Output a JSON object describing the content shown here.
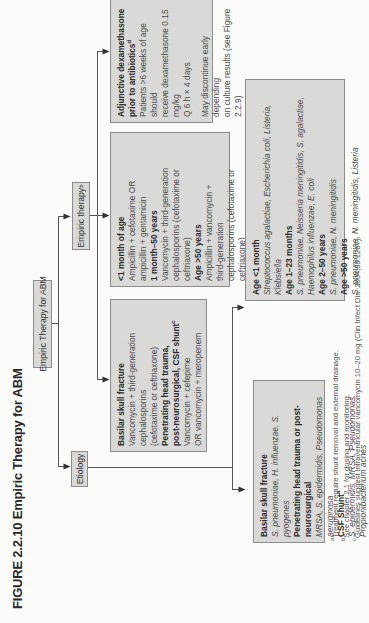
{
  "figure": {
    "title": "FIGURE 2.2.10  Empiric Therapy for ABM"
  },
  "nodes": {
    "root": {
      "label": "Empiric Therapy for ABM"
    },
    "etiology": {
      "label": "Etiology"
    },
    "empiric": {
      "label": "Empiric therapy",
      "sup": "b"
    }
  },
  "treatment_special": {
    "lines": [
      {
        "text": "Basilar skull fracture",
        "bold": true
      },
      {
        "text": "Vancomycin + third-generation"
      },
      {
        "text": "cephalosporins"
      },
      {
        "text": "(cefotaxime or ceftriaxone)"
      },
      {
        "text": "Penetrating head trauma,",
        "bold": true
      },
      {
        "text": "post-neurosurgical, CSF shunt",
        "bold": true,
        "sup": "c"
      },
      {
        "text": "Vancomycin + cefepime"
      },
      {
        "text": "OR vancomycin + meropenem"
      }
    ]
  },
  "treatment_age": {
    "lines": [
      {
        "text": "<1 month of age",
        "bold": true
      },
      {
        "text": "Ampicillin + cefotaxime OR"
      },
      {
        "text": "ampicillin + gentamicin"
      },
      {
        "text": "1 month–50 years",
        "bold": true
      },
      {
        "text": "Vancomycin + third-generation"
      },
      {
        "text": "cephalosporins (cefotaxime or ceftriaxone)"
      },
      {
        "text": "Age >50 years",
        "bold": true
      },
      {
        "text": "Ampicillin + vancomycin +"
      },
      {
        "text": "third-generation"
      },
      {
        "text": "cephalosporins (cefotaxime or ceftriaxone)"
      }
    ]
  },
  "dexamethasone": {
    "title1": "Adjunctive dexamethasone",
    "title2": "prior to antibiotics",
    "title2_sup": "d",
    "lines": [
      "Patients >6 weeks of age should",
      "receive dexamethasone 0.15 mg/kg",
      "Q 6 h × 4 days"
    ],
    "note": [
      "May discontinue early depending",
      "on culture results (see Figure 2.2.9)"
    ]
  },
  "organisms_age": {
    "lines": [
      {
        "text": "Age <1 month",
        "bold": true
      },
      {
        "text": "Streptococcus agalactiae, Escherichia coli, Listeria, Klebsiella",
        "italic": true
      },
      {
        "text": "Age 1–23 months",
        "bold": true
      },
      {
        "text": "S. pneumoniae, Neisseria meningitidis, S. agalactiae, Haemophilus influenzae, E. coli",
        "italic": true
      },
      {
        "text": "Age 2–50 years",
        "bold": true
      },
      {
        "text": "S. pneumoniae, N. meningitidis",
        "italic": true
      },
      {
        "text": "Age >50 years",
        "bold": true
      },
      {
        "text": "S. pneumoniae, N. meningitidis, Listeria",
        "italic": true
      }
    ]
  },
  "organisms_special": {
    "lines": [
      {
        "text": "Basilar skull fracture",
        "bold": true
      },
      {
        "text": "S. pneumoniae, H. influenzae, S. pyogenes",
        "italic": true
      },
      {
        "text": "Penetrating head trauma or post-neurosurgical",
        "bold": true
      },
      {
        "text": "MRSA, S. epidermidis, Pseudomonas aeruginosa",
        "italic": true
      },
      {
        "text": "CSF Shunt",
        "bold": true,
        "sup": "a"
      },
      {
        "text": "S. epidermidis, MRSA, Pseudomonas, Propionibacterium acnes",
        "italic": true
      }
    ]
  },
  "footnotes": [
    {
      "sup": "a",
      "text": "Treatment require shunt removal and external drainage."
    },
    {
      "sup": "b",
      "text": "See chapter 2.1 for dosing and monitoring."
    },
    {
      "sup": "c",
      "text": "Guidelines suggest intraventricular vancomycin 10–20 mg (Clin Infect Dis. 2004;39:1267)."
    }
  ],
  "colors": {
    "box_fill": "#d9d9d7",
    "box_border": "#8c8c8c",
    "line": "#555555",
    "background": "#fbfbfa"
  }
}
